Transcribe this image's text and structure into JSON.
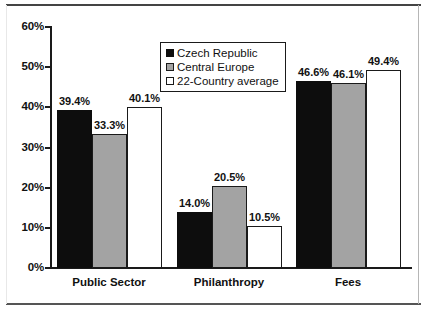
{
  "chart_data": {
    "type": "bar",
    "title": "",
    "subtitle": "",
    "xlabel": "",
    "ylabel": "",
    "categories": [
      "Public Sector",
      "Philanthropy",
      "Fees"
    ],
    "series": [
      {
        "name": "Czech Republic",
        "color": "#0d0d0d",
        "values": [
          39.4,
          14.0,
          46.6
        ],
        "value_labels": [
          "39.4%",
          "14.0%",
          "46.6%"
        ]
      },
      {
        "name": "Central Europe",
        "color": "#a3a3a3",
        "values": [
          33.3,
          20.5,
          46.1
        ],
        "value_labels": [
          "33.3%",
          "20.5%",
          "46.1%"
        ]
      },
      {
        "name": "22-Country average",
        "color": "#ffffff",
        "values": [
          40.1,
          10.5,
          49.4
        ],
        "value_labels": [
          "40.1%",
          "10.5%",
          "49.4%"
        ]
      }
    ],
    "ylim": [
      0,
      60
    ],
    "ytick_values": [
      0,
      10,
      20,
      30,
      40,
      50,
      60
    ],
    "ytick_labels": [
      "0%",
      "10%",
      "20%",
      "30%",
      "40%",
      "50%",
      "60%"
    ],
    "grid": false,
    "legend_position": "top-center-right",
    "value_labels_shown": true
  },
  "legend": {
    "items": [
      {
        "label": "Czech Republic"
      },
      {
        "label": "Central Europe"
      },
      {
        "label": "22-Country average"
      }
    ]
  },
  "colors": {
    "series_1": "#0d0d0d",
    "series_2": "#a3a3a3",
    "series_3": "#ffffff",
    "axis": "#1a1a1a",
    "text": "#111111",
    "background": "#ffffff"
  }
}
